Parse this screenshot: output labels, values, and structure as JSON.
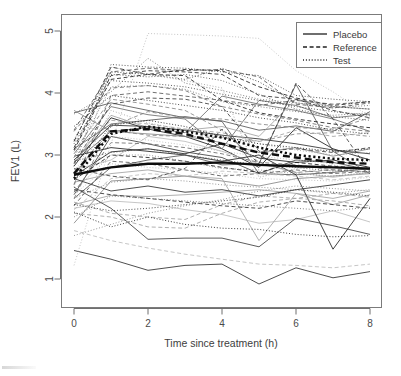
{
  "figure": {
    "kind": "spaghetti-plot",
    "background": "#ffffff",
    "width": 401,
    "height": 376
  },
  "axes": {
    "x_title": "Time since treatment (h)",
    "y_title": "FEV1 (L)",
    "x_ticks": [
      "0",
      "2",
      "4",
      "6",
      "8"
    ],
    "y_ticks": [
      "1",
      "2",
      "3",
      "4",
      "5"
    ]
  },
  "legend": {
    "position": "top-right",
    "items": [
      {
        "label": "Placebo",
        "style": "solid",
        "color": "#202020"
      },
      {
        "label": "Reference",
        "style": "dashed",
        "color": "#202020"
      },
      {
        "label": "Test",
        "style": "dotted",
        "color": "#202020"
      }
    ]
  },
  "chart_data": {
    "type": "line",
    "title": "",
    "xlabel": "Time since treatment (h)",
    "ylabel": "FEV1 (L)",
    "xlim": [
      -0.25,
      8.3
    ],
    "ylim": [
      0.78,
      5.08
    ],
    "xticks": [
      0,
      2,
      4,
      6,
      8
    ],
    "yticks": [
      1,
      2,
      3,
      4,
      5
    ],
    "grid": false,
    "legend_position": "top-right",
    "x": [
      0,
      1,
      2,
      3,
      4,
      5,
      6,
      7,
      8
    ],
    "series": [
      {
        "name": "Placebo-01",
        "group": "Placebo",
        "style": "solid",
        "values": [
          2.66,
          3.05,
          3.1,
          3.02,
          3.18,
          2.95,
          2.88,
          2.92,
          2.8
        ]
      },
      {
        "name": "Placebo-02",
        "group": "Placebo",
        "style": "solid",
        "values": [
          3.68,
          3.84,
          3.72,
          3.6,
          3.55,
          3.4,
          3.47,
          3.38,
          3.7
        ]
      },
      {
        "name": "Placebo-03",
        "group": "Placebo",
        "style": "solid",
        "values": [
          2.2,
          2.35,
          2.33,
          2.36,
          2.4,
          2.44,
          2.38,
          2.3,
          2.42
        ]
      },
      {
        "name": "Placebo-04",
        "group": "Placebo",
        "style": "solid",
        "values": [
          1.46,
          1.32,
          1.14,
          1.22,
          1.24,
          0.92,
          1.18,
          1.02,
          1.12
        ]
      },
      {
        "name": "Placebo-05",
        "group": "Placebo",
        "style": "solid",
        "values": [
          2.88,
          3.38,
          3.44,
          3.36,
          3.95,
          3.82,
          3.72,
          3.58,
          3.38
        ]
      },
      {
        "name": "Placebo-06",
        "group": "Placebo",
        "style": "solid",
        "values": [
          2.14,
          2.26,
          2.22,
          2.12,
          2.04,
          1.9,
          1.96,
          2.1,
          1.92
        ]
      },
      {
        "name": "Placebo-07",
        "group": "Placebo",
        "style": "solid",
        "values": [
          2.36,
          3.3,
          3.18,
          3.05,
          2.96,
          2.7,
          2.92,
          2.88,
          2.76
        ]
      },
      {
        "name": "Placebo-08",
        "group": "Placebo",
        "style": "solid",
        "values": [
          1.9,
          2.58,
          2.62,
          2.66,
          2.58,
          2.5,
          2.62,
          2.66,
          2.7
        ]
      },
      {
        "name": "Placebo-09",
        "group": "Placebo",
        "style": "solid",
        "values": [
          2.82,
          3.6,
          3.42,
          3.3,
          3.1,
          2.8,
          3.44,
          3.1,
          2.92
        ]
      },
      {
        "name": "Placebo-10",
        "group": "Placebo",
        "style": "solid",
        "values": [
          3.1,
          3.5,
          3.56,
          3.62,
          3.54,
          2.7,
          2.68,
          2.72,
          2.78
        ]
      },
      {
        "name": "Placebo-11",
        "group": "Placebo",
        "style": "solid",
        "values": [
          2.56,
          2.7,
          2.76,
          2.66,
          2.62,
          1.62,
          2.38,
          2.2,
          2.36
        ]
      },
      {
        "name": "Placebo-12",
        "group": "Placebo",
        "style": "solid",
        "values": [
          2.62,
          2.42,
          2.5,
          2.4,
          2.44,
          2.34,
          2.44,
          2.52,
          2.6
        ]
      },
      {
        "name": "Placebo-13",
        "group": "Placebo",
        "style": "solid",
        "values": [
          3.02,
          3.78,
          3.65,
          3.58,
          3.1,
          3.88,
          3.8,
          3.6,
          3.66
        ]
      },
      {
        "name": "Placebo-14",
        "group": "Placebo",
        "style": "solid",
        "values": [
          2.76,
          2.92,
          3.3,
          3.22,
          3.06,
          2.86,
          2.72,
          2.64,
          2.72
        ]
      },
      {
        "name": "Placebo-15",
        "group": "Placebo",
        "style": "solid",
        "values": [
          2.48,
          2.14,
          1.64,
          1.66,
          1.66,
          1.52,
          1.98,
          1.86,
          1.72
        ]
      },
      {
        "name": "Placebo-16",
        "group": "Placebo",
        "style": "solid",
        "values": [
          3.72,
          3.38,
          3.34,
          3.3,
          3.2,
          3.04,
          3.12,
          2.98,
          3.1
        ]
      },
      {
        "name": "Placebo-17",
        "group": "Placebo",
        "style": "solid",
        "values": [
          2.98,
          3.12,
          3.06,
          3.0,
          2.9,
          3.0,
          2.68,
          1.48,
          2.3
        ]
      },
      {
        "name": "Placebo-18",
        "group": "Placebo",
        "style": "solid",
        "values": [
          2.3,
          2.8,
          2.92,
          3.0,
          2.84,
          2.86,
          4.14,
          3.06,
          2.7
        ]
      },
      {
        "name": "Placebo-19",
        "group": "Placebo",
        "style": "solid",
        "values": [
          2.88,
          3.64,
          3.44,
          3.4,
          3.46,
          3.3,
          3.9,
          3.78,
          3.74
        ]
      },
      {
        "name": "Placebo-20",
        "group": "Placebo",
        "style": "solid",
        "values": [
          2.92,
          3.48,
          3.46,
          3.4,
          3.32,
          3.26,
          3.18,
          3.08,
          3.02
        ]
      },
      {
        "name": "Reference-01",
        "group": "Reference",
        "style": "dashed",
        "values": [
          2.3,
          3.46,
          3.7,
          3.6,
          3.58,
          3.5,
          3.44,
          3.42,
          3.6
        ]
      },
      {
        "name": "Reference-02",
        "group": "Reference",
        "style": "dashed",
        "values": [
          3.08,
          4.22,
          4.3,
          4.38,
          4.36,
          4.1,
          3.92,
          3.8,
          3.86
        ]
      },
      {
        "name": "Reference-03",
        "group": "Reference",
        "style": "dashed",
        "values": [
          2.52,
          3.96,
          4.02,
          3.95,
          3.88,
          3.8,
          3.88,
          3.82,
          3.86
        ]
      },
      {
        "name": "Reference-04",
        "group": "Reference",
        "style": "dashed",
        "values": [
          2.06,
          2.0,
          1.84,
          1.82,
          2.06,
          2.24,
          2.3,
          2.26,
          2.18
        ]
      },
      {
        "name": "Reference-05",
        "group": "Reference",
        "style": "dashed",
        "values": [
          3.12,
          4.28,
          4.36,
          4.34,
          4.3,
          3.96,
          3.9,
          3.72,
          3.6
        ]
      },
      {
        "name": "Reference-06",
        "group": "Reference",
        "style": "dashed",
        "values": [
          2.4,
          3.2,
          3.18,
          3.12,
          3.02,
          2.88,
          2.84,
          2.76,
          2.72
        ]
      },
      {
        "name": "Reference-07",
        "group": "Reference",
        "style": "dashed",
        "values": [
          1.78,
          1.62,
          1.5,
          1.4,
          1.32,
          1.24,
          1.22,
          1.18,
          1.24
        ]
      },
      {
        "name": "Reference-08",
        "group": "Reference",
        "style": "dashed",
        "values": [
          2.86,
          3.82,
          3.92,
          3.9,
          3.78,
          3.06,
          3.1,
          3.04,
          3.12
        ]
      },
      {
        "name": "Reference-09",
        "group": "Reference",
        "style": "dashed",
        "values": [
          2.7,
          3.4,
          3.32,
          3.3,
          3.28,
          3.22,
          3.34,
          3.36,
          3.3
        ]
      },
      {
        "name": "Reference-10",
        "group": "Reference",
        "style": "dashed",
        "values": [
          3.22,
          4.42,
          4.3,
          4.28,
          3.88,
          3.68,
          3.58,
          3.5,
          3.44
        ]
      },
      {
        "name": "Reference-11",
        "group": "Reference",
        "style": "dashed",
        "values": [
          2.18,
          2.9,
          2.86,
          2.76,
          2.66,
          2.7,
          2.76,
          2.7,
          2.74
        ]
      },
      {
        "name": "Reference-12",
        "group": "Reference",
        "style": "dashed",
        "values": [
          2.96,
          3.56,
          3.5,
          3.42,
          3.36,
          3.22,
          3.4,
          3.3,
          3.36
        ]
      },
      {
        "name": "Reference-13",
        "group": "Reference",
        "style": "dashed",
        "values": [
          2.44,
          2.36,
          2.3,
          2.24,
          2.18,
          2.14,
          2.26,
          2.2,
          2.14
        ]
      },
      {
        "name": "Reference-14",
        "group": "Reference",
        "style": "dashed",
        "values": [
          3.38,
          4.08,
          4.12,
          4.04,
          3.78,
          3.66,
          3.56,
          3.44,
          3.38
        ]
      },
      {
        "name": "Reference-15",
        "group": "Reference",
        "style": "dashed",
        "values": [
          2.12,
          2.62,
          2.7,
          2.66,
          2.74,
          2.7,
          2.66,
          2.6,
          2.66
        ]
      },
      {
        "name": "Reference-16",
        "group": "Reference",
        "style": "dashed",
        "values": [
          2.78,
          2.66,
          2.6,
          2.78,
          3.42,
          2.86,
          4.16,
          3.58,
          2.72
        ]
      },
      {
        "name": "Reference-17",
        "group": "Reference",
        "style": "dashed",
        "values": [
          3.06,
          3.9,
          3.82,
          3.72,
          3.4,
          2.88,
          2.72,
          2.76,
          2.8
        ]
      },
      {
        "name": "Reference-18",
        "group": "Reference",
        "style": "dashed",
        "values": [
          2.6,
          3.0,
          2.96,
          2.9,
          2.8,
          2.72,
          2.88,
          2.82,
          2.78
        ]
      },
      {
        "name": "Reference-19",
        "group": "Reference",
        "style": "dashed",
        "values": [
          3.4,
          4.34,
          4.4,
          4.36,
          4.38,
          4.26,
          3.82,
          3.76,
          3.84
        ]
      },
      {
        "name": "Reference-20",
        "group": "Reference",
        "style": "dashed",
        "values": [
          2.24,
          2.06,
          2.0,
          1.96,
          2.2,
          2.34,
          2.3,
          2.38,
          2.32
        ]
      },
      {
        "name": "Test-01",
        "group": "Test",
        "style": "dotted",
        "values": [
          3.66,
          4.02,
          4.56,
          4.16,
          4.04,
          3.9,
          3.84,
          3.76,
          3.8
        ]
      },
      {
        "name": "Test-02",
        "group": "Test",
        "style": "dotted",
        "values": [
          1.22,
          3.18,
          4.96,
          4.94,
          4.92,
          4.88,
          4.36,
          4.02,
          3.62
        ]
      },
      {
        "name": "Test-03",
        "group": "Test",
        "style": "dotted",
        "values": [
          2.82,
          4.46,
          4.42,
          4.4,
          4.34,
          4.28,
          3.96,
          3.9,
          3.86
        ]
      },
      {
        "name": "Test-04",
        "group": "Test",
        "style": "dotted",
        "values": [
          2.42,
          3.0,
          3.0,
          2.9,
          2.78,
          2.76,
          2.7,
          2.66,
          2.72
        ]
      },
      {
        "name": "Test-05",
        "group": "Test",
        "style": "dotted",
        "values": [
          2.08,
          1.84,
          2.0,
          1.88,
          1.82,
          1.8,
          1.72,
          1.68,
          1.7
        ]
      },
      {
        "name": "Test-06",
        "group": "Test",
        "style": "dotted",
        "values": [
          3.08,
          4.3,
          4.26,
          4.3,
          4.2,
          3.98,
          3.74,
          3.62,
          3.56
        ]
      },
      {
        "name": "Test-07",
        "group": "Test",
        "style": "dotted",
        "values": [
          2.54,
          3.72,
          3.52,
          3.4,
          3.28,
          3.18,
          3.08,
          3.0,
          3.04
        ]
      },
      {
        "name": "Test-08",
        "group": "Test",
        "style": "dotted",
        "values": [
          2.2,
          2.1,
          2.14,
          2.2,
          2.26,
          2.32,
          2.44,
          2.4,
          2.34
        ]
      },
      {
        "name": "Test-09",
        "group": "Test",
        "style": "dotted",
        "values": [
          2.96,
          4.1,
          4.12,
          4.06,
          3.86,
          3.78,
          3.7,
          3.64,
          3.68
        ]
      },
      {
        "name": "Test-10",
        "group": "Test",
        "style": "dotted",
        "values": [
          2.36,
          2.86,
          2.8,
          2.76,
          2.7,
          2.62,
          2.6,
          2.58,
          2.64
        ]
      },
      {
        "name": "Test-11",
        "group": "Test",
        "style": "dotted",
        "values": [
          3.24,
          4.34,
          4.3,
          4.22,
          4.4,
          4.18,
          3.84,
          3.78,
          3.74
        ]
      },
      {
        "name": "Test-12",
        "group": "Test",
        "style": "dotted",
        "values": [
          1.7,
          1.88,
          2.06,
          2.18,
          2.28,
          2.42,
          2.5,
          2.46,
          2.42
        ]
      },
      {
        "name": "Test-13",
        "group": "Test",
        "style": "dotted",
        "values": [
          2.66,
          3.48,
          3.56,
          3.46,
          3.3,
          3.18,
          3.12,
          3.06,
          3.1
        ]
      },
      {
        "name": "Test-14",
        "group": "Test",
        "style": "dotted",
        "values": [
          2.9,
          3.04,
          3.1,
          3.0,
          2.92,
          2.84,
          2.8,
          2.74,
          2.78
        ]
      },
      {
        "name": "Test-15",
        "group": "Test",
        "style": "dotted",
        "values": [
          2.48,
          4.42,
          4.3,
          4.2,
          4.08,
          2.64,
          2.78,
          2.84,
          2.7
        ]
      },
      {
        "name": "Test-16",
        "group": "Test",
        "style": "dotted",
        "values": [
          3.46,
          3.96,
          3.88,
          3.8,
          3.72,
          3.6,
          3.52,
          3.4,
          3.34
        ]
      },
      {
        "name": "Test-17",
        "group": "Test",
        "style": "dotted",
        "values": [
          2.0,
          2.34,
          2.3,
          2.26,
          2.22,
          2.18,
          2.14,
          2.1,
          2.16
        ]
      },
      {
        "name": "Test-18",
        "group": "Test",
        "style": "dotted",
        "values": [
          2.76,
          3.3,
          3.24,
          3.16,
          3.06,
          2.98,
          2.92,
          2.86,
          2.9
        ]
      },
      {
        "name": "Test-19",
        "group": "Test",
        "style": "dotted",
        "values": [
          3.18,
          4.2,
          4.16,
          4.1,
          3.98,
          3.88,
          3.78,
          3.7,
          3.64
        ]
      },
      {
        "name": "Test-20",
        "group": "Test",
        "style": "dotted",
        "values": [
          2.3,
          2.56,
          2.62,
          2.58,
          2.52,
          2.48,
          2.44,
          2.38,
          2.44
        ]
      }
    ],
    "mean_series": [
      {
        "name": "Placebo mean",
        "group": "Placebo",
        "style": "solid",
        "emphasis": true,
        "values": [
          2.68,
          2.8,
          2.86,
          2.86,
          2.88,
          2.84,
          2.82,
          2.8,
          2.78
        ]
      },
      {
        "name": "Reference mean",
        "group": "Reference",
        "style": "dashed",
        "emphasis": true,
        "values": [
          2.7,
          3.38,
          3.42,
          3.34,
          3.18,
          3.04,
          2.96,
          2.88,
          2.86
        ]
      },
      {
        "name": "Test mean",
        "group": "Test",
        "style": "dotted",
        "emphasis": true,
        "values": [
          2.62,
          3.34,
          3.46,
          3.38,
          3.28,
          3.12,
          3.0,
          2.94,
          2.92
        ]
      }
    ]
  }
}
